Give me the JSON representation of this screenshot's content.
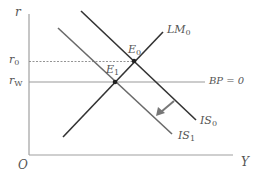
{
  "diagram": {
    "axes": {
      "y_label": "r",
      "x_label": "Y",
      "origin_label": "O"
    },
    "y_ticks": [
      {
        "base": "r",
        "sub": "0",
        "y": 62
      },
      {
        "base": "r",
        "sub": "W",
        "y": 82
      }
    ],
    "curves": [
      {
        "id": "LM0",
        "base": "LM",
        "sub": "0",
        "x1": 63,
        "y1": 137,
        "x2": 163,
        "y2": 32
      },
      {
        "id": "IS0",
        "base": "IS",
        "sub": "0",
        "x1": 81,
        "y1": 11,
        "x2": 196,
        "y2": 120
      },
      {
        "id": "IS1",
        "base": "IS",
        "sub": "1",
        "x1": 58,
        "y1": 28,
        "x2": 172,
        "y2": 134
      }
    ],
    "bp_line": {
      "label": "BP = 0",
      "y": 82,
      "x1": 29,
      "x2": 205
    },
    "points": [
      {
        "id": "E0",
        "base": "E",
        "sub": "0",
        "x": 134,
        "y": 61
      },
      {
        "id": "E1",
        "base": "E",
        "sub": "1",
        "x": 115,
        "y": 82
      }
    ],
    "shift_arrow": {
      "from": [
        174,
        101
      ],
      "to": [
        158,
        115
      ],
      "meaning": "IS shifts left from IS0 to IS1"
    },
    "colors": {
      "curve": "#333333",
      "is1": "#666666",
      "axis": "#999999",
      "bp": "#999999",
      "arrow": "#777777",
      "label": "#555555"
    }
  },
  "labels": {
    "r": "r",
    "Y": "Y",
    "O": "O",
    "r0_base": "r",
    "r0_sub": "0",
    "rw_base": "r",
    "rw_sub": "W",
    "lm0_base": "LM",
    "lm0_sub": "0",
    "is0_base": "IS",
    "is0_sub": "0",
    "is1_base": "IS",
    "is1_sub": "1",
    "e0_base": "E",
    "e0_sub": "0",
    "e1_base": "E",
    "e1_sub": "1",
    "bp": "BP = 0"
  }
}
